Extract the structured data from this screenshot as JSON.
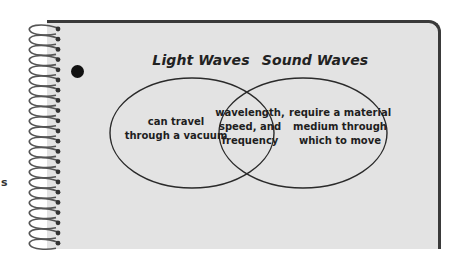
{
  "diagram": {
    "type": "venn",
    "sets": [
      {
        "name": "Light Waves",
        "unique": [
          "can travel",
          "through a vacuum"
        ]
      },
      {
        "name": "Sound Waves",
        "unique": [
          "require a material",
          "medium through",
          "which to move"
        ]
      }
    ],
    "intersection": [
      "wavelength,",
      "speed, and",
      "frequency"
    ]
  },
  "margin_text": "s",
  "colors": {
    "page_bg": "#ffffff",
    "notebook_bg": "#e3e3e3",
    "border": "#3a3a3a",
    "line": "#2a2a2a",
    "text": "#1e1e1e"
  }
}
